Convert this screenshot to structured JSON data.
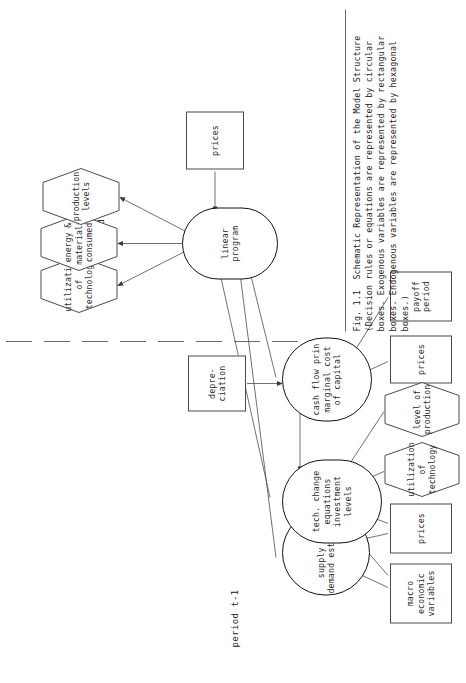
{
  "figure": {
    "page_number": "15",
    "periods": {
      "left_label": "period t-1",
      "right_label": "period t"
    },
    "caption": {
      "lines": [
        "Fig. 1.1  Schematic Representation of the Model Structure",
        "(Decision rules or equations are represented by circular",
        "boxes. Exogenous variables are represented by rectangular",
        "boxes. Endogenous variables are represented by hexagonal",
        "boxes.)"
      ]
    },
    "nodes": {
      "decision_rules": [
        {
          "id": "supply-demand",
          "label": "supply and\ndemand estimates",
          "shape": "oval"
        },
        {
          "id": "tech-change",
          "label": "tech. change\nequations\ninvestment\nlevels",
          "shape": "oval"
        },
        {
          "id": "cash-flow",
          "label": "cash flow prin\nmarginal cost\nof capital",
          "shape": "oval"
        },
        {
          "id": "linear-program",
          "label": "linear\nprogram",
          "shape": "oval"
        }
      ],
      "exogenous": [
        {
          "id": "macro-economic-variables",
          "label": "macro\neconomic\nvariables",
          "shape": "rect"
        },
        {
          "id": "prices-t1-a",
          "label": "prices",
          "shape": "rect"
        },
        {
          "id": "prices-t1-b",
          "label": "prices",
          "shape": "rect"
        },
        {
          "id": "payoff-period",
          "label": "payoff\nperiod",
          "shape": "rect"
        },
        {
          "id": "depreciation",
          "label": "depre-\nciation",
          "shape": "rect"
        },
        {
          "id": "prices-t",
          "label": "prices",
          "shape": "rect"
        }
      ],
      "endogenous": [
        {
          "id": "utilization-of-technology-in",
          "label": "utilization\nof\ntechnology",
          "shape": "hex"
        },
        {
          "id": "level-of-production",
          "label": "level of\nproduction",
          "shape": "hex"
        },
        {
          "id": "utilization-of-technology-out",
          "label": "utilization\nof\ntechnology",
          "shape": "hex"
        },
        {
          "id": "energy-materials-consumed",
          "label": "energy &\nmaterials\nconsumed",
          "shape": "hex"
        },
        {
          "id": "production-levels",
          "label": "production\nlevels",
          "shape": "hex"
        }
      ]
    },
    "colors": {
      "ink": "#2a2a2a",
      "rule_stroke": "#4a4a4a",
      "oval_stroke": "#111111",
      "edge_stroke": "#575757",
      "paper": "#ffffff"
    }
  }
}
